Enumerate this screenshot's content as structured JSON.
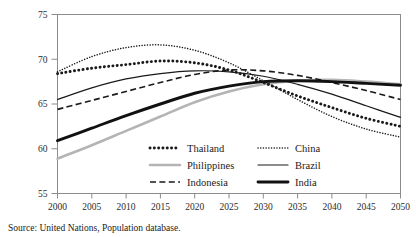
{
  "chart_data": {
    "type": "line",
    "title": "",
    "subtitle": "",
    "xlabel": "",
    "ylabel": "",
    "xlim": [
      2000,
      2050
    ],
    "ylim": [
      55,
      75
    ],
    "xticks": [
      "2000",
      "2005",
      "2010",
      "2015",
      "2020",
      "2025",
      "2030",
      "2035",
      "2040",
      "2045",
      "2050"
    ],
    "yticks": [
      "55",
      "60",
      "65",
      "70",
      "75"
    ],
    "grid": false,
    "legend_position": "inside-bottom-center",
    "source": "Source: United Nations, Population database.",
    "x": [
      2000,
      2005,
      2010,
      2015,
      2020,
      2025,
      2030,
      2035,
      2040,
      2045,
      2050
    ],
    "series": [
      {
        "name": "Thailand",
        "style": "thick-dotted",
        "color": "#1a1a1a",
        "values": [
          68.4,
          69.0,
          69.4,
          69.8,
          69.6,
          68.8,
          67.4,
          65.9,
          64.6,
          63.4,
          62.5
        ]
      },
      {
        "name": "Philippines",
        "style": "gray-solid",
        "color": "#b4b4b4",
        "values": [
          58.9,
          60.4,
          62.0,
          63.6,
          65.2,
          66.4,
          67.2,
          67.6,
          67.7,
          67.5,
          67.2
        ]
      },
      {
        "name": "Indonesia",
        "style": "dashed",
        "color": "#1a1a1a",
        "values": [
          64.4,
          65.4,
          66.4,
          67.4,
          68.3,
          68.8,
          68.7,
          68.2,
          67.4,
          66.5,
          65.5
        ]
      },
      {
        "name": "China",
        "style": "fine-dotted",
        "color": "#1a1a1a",
        "values": [
          68.6,
          70.3,
          71.3,
          71.6,
          71.0,
          69.6,
          67.6,
          65.5,
          63.6,
          62.2,
          61.3
        ]
      },
      {
        "name": "Brazil",
        "style": "thin-solid",
        "color": "#1a1a1a",
        "values": [
          65.5,
          66.8,
          67.8,
          68.4,
          68.7,
          68.6,
          68.1,
          67.2,
          66.1,
          64.8,
          63.5
        ]
      },
      {
        "name": "India",
        "style": "thick-solid",
        "color": "#111111",
        "values": [
          60.9,
          62.3,
          63.7,
          65.0,
          66.2,
          67.0,
          67.5,
          67.6,
          67.5,
          67.3,
          67.1
        ]
      }
    ],
    "legend": [
      {
        "label": "Thailand",
        "style": "thick-dotted",
        "column": 0,
        "row": 0
      },
      {
        "label": "Philippines",
        "style": "gray-solid",
        "column": 0,
        "row": 1
      },
      {
        "label": "Indonesia",
        "style": "dashed",
        "column": 0,
        "row": 2
      },
      {
        "label": "China",
        "style": "fine-dotted",
        "column": 1,
        "row": 0
      },
      {
        "label": "Brazil",
        "style": "thin-solid",
        "column": 1,
        "row": 1
      },
      {
        "label": "India",
        "style": "thick-solid",
        "column": 1,
        "row": 2
      }
    ]
  }
}
